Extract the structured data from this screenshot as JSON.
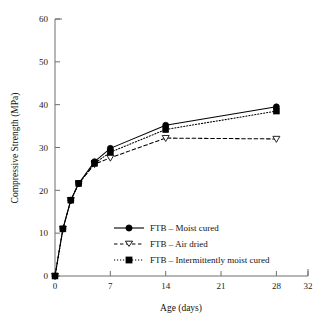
{
  "chart_data": {
    "type": "line",
    "title": "",
    "xlabel": "Age (days)",
    "ylabel": "Compressive Strength (MPa)",
    "xlim": [
      0,
      32
    ],
    "ylim": [
      0,
      60
    ],
    "xticks": [
      0,
      7,
      14,
      21,
      28,
      32
    ],
    "xtick_labels": [
      "0",
      "7",
      "14",
      "21",
      "28",
      "32"
    ],
    "yticks": [
      0,
      10,
      20,
      30,
      40,
      50,
      60
    ],
    "ytick_labels": [
      "0",
      "10",
      "20",
      "30",
      "40",
      "50",
      "60"
    ],
    "grid": false,
    "legend_position": "lower center-right inside axes",
    "x": [
      0,
      1,
      2,
      3,
      5,
      7,
      14,
      28
    ],
    "series": [
      {
        "name": "FTB – Moist cured",
        "marker": "filled-circle",
        "line": "solid",
        "color": "#000000",
        "values": [
          0,
          11.0,
          17.7,
          21.6,
          26.7,
          29.8,
          35.2,
          39.5
        ]
      },
      {
        "name": "FTB – Air dried",
        "marker": "open-down-triangle",
        "line": "dashed",
        "color": "#000000",
        "values": [
          0,
          11.0,
          17.7,
          21.6,
          26.1,
          27.6,
          32.2,
          32.0
        ]
      },
      {
        "name": "FTB – Intermittently moist cured",
        "marker": "filled-square",
        "line": "dotted",
        "color": "#000000",
        "values": [
          0,
          11.0,
          17.7,
          21.6,
          26.3,
          28.9,
          34.2,
          38.5
        ]
      }
    ]
  },
  "legend": {
    "items": [
      {
        "label": "FTB – Moist cured"
      },
      {
        "label": "FTB – Air dried"
      },
      {
        "label": "FTB – Intermittently moist cured"
      }
    ]
  },
  "colors": {
    "axis": "#6f6f6f",
    "series": "#000000",
    "background": "#ffffff"
  }
}
